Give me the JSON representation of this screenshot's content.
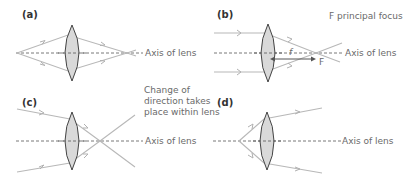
{
  "panels": [
    {
      "id": "a",
      "label": "(a)",
      "axis_label": "Axis of lens"
    },
    {
      "id": "b",
      "label": "(b)",
      "axis_label": "Axis of lens",
      "annotation": "F principal focus",
      "focal_length_label": "f",
      "focus_label": "F"
    },
    {
      "id": "c",
      "label": "(c)",
      "axis_label": "Axis of lens",
      "annotation_lines": [
        "Change of",
        "direction takes",
        "place within lens"
      ]
    },
    {
      "id": "d",
      "label": "(d)",
      "axis_label": "Axis of lens"
    }
  ],
  "colors": {
    "ray": "#b8b8b8",
    "lens_fill": "#d9d9d9",
    "lens_stroke": "#333333",
    "axis": "#555555",
    "text": "#6a6a6a"
  }
}
